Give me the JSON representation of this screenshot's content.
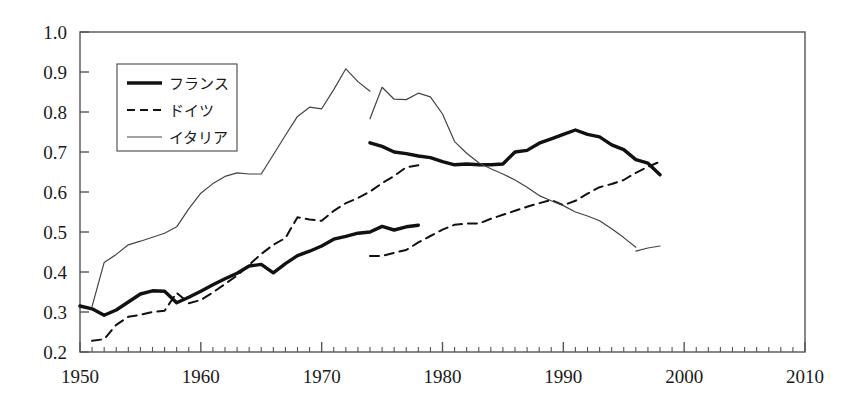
{
  "chart_data": {
    "type": "line",
    "title": "",
    "xlabel": "",
    "ylabel": "",
    "xlim": [
      1950,
      2010
    ],
    "ylim": [
      0.2,
      1.0
    ],
    "x_ticks": [
      1950,
      1960,
      1970,
      1980,
      1990,
      2000,
      2010
    ],
    "x_tick_labels": [
      "1950",
      "1960",
      "1970",
      "1980",
      "1990",
      "2000",
      "2010"
    ],
    "x_minor_tick_step": 1,
    "y_ticks": [
      0.2,
      0.3,
      0.4,
      0.5,
      0.6,
      0.7,
      0.8,
      0.9,
      1.0
    ],
    "y_tick_labels": [
      "0.2",
      "0.3",
      "0.4",
      "0.5",
      "0.6",
      "0.7",
      "0.8",
      "0.9",
      "1.0"
    ],
    "grid": false,
    "legend_position": "upper-left",
    "series": [
      {
        "name": "フランス",
        "style": "thick-solid",
        "color": "#111111",
        "segments": [
          {
            "x": [
              1950,
              1951,
              1952,
              1953,
              1954,
              1955,
              1956,
              1957,
              1958,
              1959,
              1960,
              1961,
              1962,
              1963,
              1964,
              1965,
              1966,
              1967,
              1968,
              1969,
              1970,
              1971,
              1972,
              1973,
              1974,
              1975,
              1976,
              1977,
              1978
            ],
            "y": [
              0.315,
              0.308,
              0.292,
              0.305,
              0.325,
              0.345,
              0.353,
              0.352,
              0.323,
              0.337,
              0.352,
              0.368,
              0.383,
              0.397,
              0.415,
              0.419,
              0.398,
              0.421,
              0.441,
              0.452,
              0.465,
              0.482,
              0.489,
              0.497,
              0.5,
              0.514,
              0.505,
              0.513,
              0.517
            ]
          },
          {
            "x": [
              1974,
              1975,
              1976,
              1977,
              1978,
              1979,
              1980,
              1981,
              1982,
              1983,
              1984,
              1985,
              1986,
              1987,
              1988,
              1989,
              1990,
              1991,
              1992,
              1993,
              1994,
              1995,
              1996,
              1997,
              1998
            ],
            "y": [
              0.723,
              0.714,
              0.7,
              0.696,
              0.69,
              0.686,
              0.676,
              0.668,
              0.67,
              0.668,
              0.668,
              0.67,
              0.7,
              0.704,
              0.722,
              0.733,
              0.744,
              0.755,
              0.744,
              0.738,
              0.718,
              0.706,
              0.681,
              0.672,
              0.643
            ]
          }
        ]
      },
      {
        "name": "ドイツ",
        "style": "dashed",
        "color": "#111111",
        "segments": [
          {
            "x": [
              1951,
              1952,
              1953,
              1954,
              1955,
              1956,
              1957,
              1958,
              1959,
              1960,
              1961,
              1962,
              1963,
              1964,
              1965,
              1966,
              1967,
              1968,
              1969,
              1970,
              1971,
              1972,
              1973,
              1974,
              1975,
              1976,
              1977,
              1978
            ],
            "y": [
              0.228,
              0.232,
              0.268,
              0.288,
              0.293,
              0.3,
              0.303,
              0.348,
              0.322,
              0.33,
              0.349,
              0.37,
              0.391,
              0.418,
              0.445,
              0.468,
              0.485,
              0.537,
              0.531,
              0.528,
              0.553,
              0.572,
              0.585,
              0.601,
              0.622,
              0.64,
              0.662,
              0.667
            ]
          },
          {
            "x": [
              1974,
              1975,
              1976,
              1977,
              1978,
              1979,
              1980,
              1981,
              1982,
              1983,
              1984,
              1985,
              1986,
              1987,
              1988,
              1989,
              1990,
              1991,
              1992,
              1993,
              1994,
              1995,
              1996,
              1997,
              1998
            ],
            "y": [
              0.44,
              0.44,
              0.448,
              0.455,
              0.474,
              0.49,
              0.506,
              0.518,
              0.521,
              0.521,
              0.533,
              0.543,
              0.553,
              0.563,
              0.572,
              0.58,
              0.567,
              0.578,
              0.596,
              0.612,
              0.62,
              0.63,
              0.648,
              0.663,
              0.676
            ]
          }
        ]
      },
      {
        "name": "イタリア",
        "style": "thin-solid",
        "color": "#444444",
        "segments": [
          {
            "x": [
              1951,
              1952,
              1953,
              1954,
              1955,
              1956,
              1957,
              1958,
              1959,
              1960,
              1961,
              1962,
              1963,
              1964,
              1965,
              1966,
              1967,
              1968,
              1969,
              1970,
              1971,
              1972,
              1973,
              1974
            ],
            "y": [
              0.314,
              0.424,
              0.444,
              0.468,
              0.477,
              0.487,
              0.497,
              0.513,
              0.558,
              0.597,
              0.621,
              0.639,
              0.648,
              0.645,
              0.645,
              0.693,
              0.742,
              0.789,
              0.812,
              0.808,
              0.856,
              0.908,
              0.876,
              0.852
            ]
          },
          {
            "x": [
              1974,
              1975,
              1976,
              1977,
              1978,
              1979,
              1980,
              1981,
              1982,
              1983,
              1984,
              1985,
              1986,
              1987,
              1988,
              1989,
              1990,
              1991,
              1992,
              1993,
              1994,
              1995,
              1996
            ],
            "y": [
              0.783,
              0.862,
              0.832,
              0.831,
              0.847,
              0.838,
              0.795,
              0.726,
              0.697,
              0.673,
              0.658,
              0.645,
              0.63,
              0.612,
              0.591,
              0.578,
              0.566,
              0.55,
              0.54,
              0.528,
              0.508,
              0.486,
              0.462
            ]
          },
          {
            "x": [
              1996,
              1997,
              1998
            ],
            "y": [
              0.452,
              0.46,
              0.465
            ]
          }
        ]
      }
    ]
  },
  "legend": {
    "entries": [
      {
        "label": "フランス",
        "style": "thick-solid"
      },
      {
        "label": "ドイツ",
        "style": "dashed"
      },
      {
        "label": "イタリア",
        "style": "thin-solid"
      }
    ]
  },
  "colors": {
    "frame": "#555555",
    "ink": "#1a1a1a",
    "background": "#ffffff"
  }
}
